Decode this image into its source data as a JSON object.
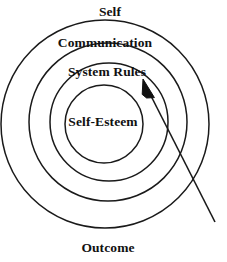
{
  "diagram": {
    "type": "concentric-rings",
    "background_color": "#ffffff",
    "stroke_color": "#1a1a1a",
    "text_color": "#111111",
    "canvas": {
      "width": 227,
      "height": 262
    },
    "rings": [
      {
        "id": "outer",
        "label": "Self",
        "label_position": "above-outside-top",
        "cx": 105,
        "cy": 124,
        "r": 104
      },
      {
        "id": "second",
        "label": "Communication",
        "label_position": "inside-top",
        "cx": 108,
        "cy": 122,
        "r": 79
      },
      {
        "id": "third",
        "label": "System Rules",
        "label_position": "inside-top",
        "cx": 109,
        "cy": 122,
        "r": 59
      },
      {
        "id": "inner",
        "label": "Self-Esteem",
        "label_position": "center",
        "cx": 104,
        "cy": 124,
        "r": 39
      }
    ],
    "outcome_label": {
      "id": "outcome",
      "label": "Outcome",
      "label_position": "below-outside-bottom"
    },
    "arrow": {
      "id": "inward-arrow",
      "description": "arrow pointing inward toward System Rules ring",
      "tail_x": 215,
      "tail_y": 222,
      "tip_x": 143,
      "tip_y": 80,
      "head_style": "solid-triangle",
      "stroke_width": 1.6
    }
  }
}
